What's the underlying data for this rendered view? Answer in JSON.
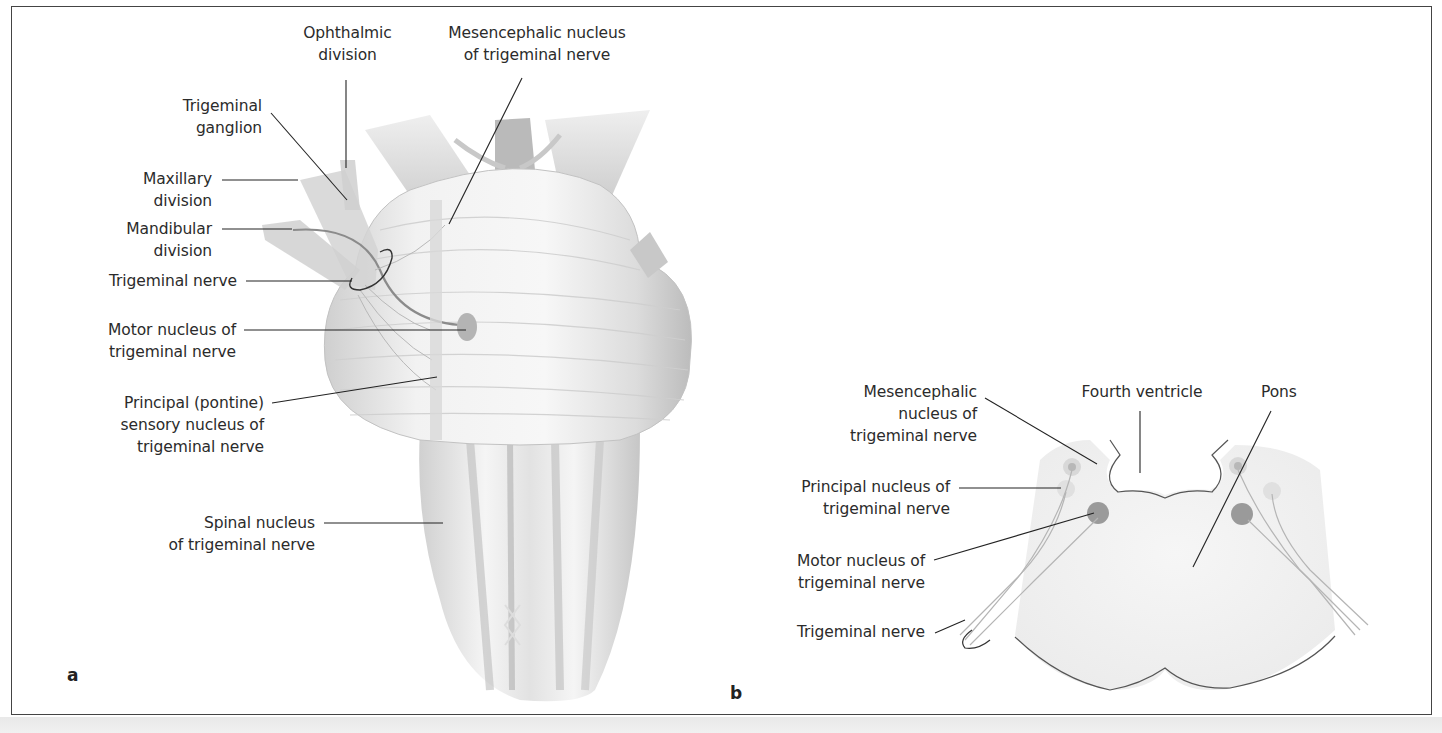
{
  "figure": {
    "panels": [
      {
        "letter": "a",
        "view": "Brainstem, lateral-anterior view with trigeminal nerve and nuclei",
        "labels": {
          "ophthalmic": [
            "Ophthalmic",
            "division"
          ],
          "mesencephalic": [
            "Mesencephalic nucleus",
            "of trigeminal nerve"
          ],
          "ganglion": [
            "Trigeminal",
            "ganglion"
          ],
          "maxillary": [
            "Maxillary",
            "division"
          ],
          "mandibular": [
            "Mandibular",
            "division"
          ],
          "trig_nerve": [
            "Trigeminal nerve"
          ],
          "motor": [
            "Motor nucleus of",
            "trigeminal nerve"
          ],
          "principal": [
            "Principal (pontine)",
            "sensory nucleus of",
            "trigeminal nerve"
          ],
          "spinal": [
            "Spinal nucleus",
            "of trigeminal nerve"
          ]
        }
      },
      {
        "letter": "b",
        "view": "Cross-section of pons at level of trigeminal nuclei",
        "labels": {
          "mesencephalic": [
            "Mesencephalic",
            "nucleus of",
            "trigeminal nerve"
          ],
          "fourth_ventricle": [
            "Fourth ventricle"
          ],
          "pons": [
            "Pons"
          ],
          "principal": [
            "Principal nucleus of",
            "trigeminal nerve"
          ],
          "motor": [
            "Motor nucleus of",
            "trigeminal nerve"
          ],
          "trig_nerve": [
            "Trigeminal nerve"
          ]
        }
      }
    ],
    "colors": {
      "frame": "#444444",
      "leader_line": "#222222",
      "motor_nucleus": "#9a9a9a",
      "sensory_nucleus": "#d9d9d9",
      "pons_fill": "#f0f0f0",
      "strip": "#ececec"
    }
  }
}
